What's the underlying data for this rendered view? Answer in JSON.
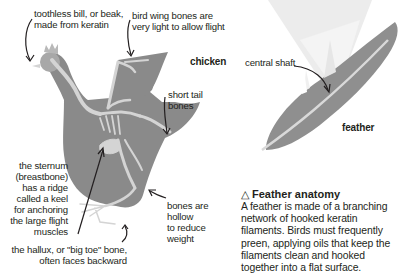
{
  "chicken": {
    "title": "chicken",
    "labels": {
      "bill": [
        "toothless bill, or beak,",
        "made from keratin"
      ],
      "wing": [
        "bird wing bones are",
        "very light to allow flight"
      ],
      "tail": [
        "short tail",
        "bones"
      ],
      "sternum": [
        "the sternum",
        "(breastbone)",
        "has a ridge",
        "called a keel",
        "for anchoring",
        "the large flight",
        "muscles"
      ],
      "hollow": [
        "bones are",
        "hollow",
        "to reduce",
        "weight"
      ],
      "hallux": [
        "the hallux, or \"big toe\" bone,",
        "often faces backward"
      ]
    }
  },
  "feather": {
    "title": "feather",
    "shaft_label": "central shaft"
  },
  "caption": {
    "icon": "triangle-icon",
    "icon_glyph": "△",
    "title": "Feather anatomy",
    "body": "A feather is made of a branching network of hooked keratin filaments. Birds must frequently preen, applying oils that keep the filaments clean and hooked together into a flat surface."
  },
  "colors": {
    "body_gray": "#8a8a8a",
    "bone": "#d4d4d4",
    "feather_gray": "#8f8f8f",
    "light_beam": "#ececec",
    "text": "#231f20"
  }
}
